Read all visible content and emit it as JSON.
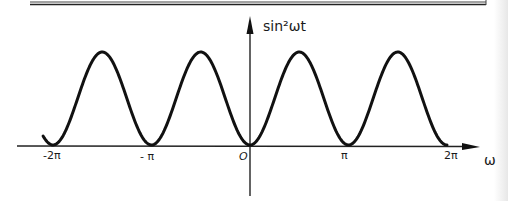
{
  "chart_data": {
    "type": "line",
    "title": "",
    "function": "sin^2(ωt)",
    "xlabel": "ω",
    "ylabel": "sin²ωt",
    "x_tick_labels": [
      "-2π",
      "- π",
      "O",
      "π",
      "2π"
    ],
    "x_ticks": [
      -6.2832,
      -3.1416,
      0,
      3.1416,
      6.2832
    ],
    "xlim": [
      -7.0,
      7.6
    ],
    "ylim": [
      0,
      1.1
    ],
    "grid": false,
    "legend": "none",
    "series": [
      {
        "name": "sin²ωt",
        "x": [
          -6.6,
          -6.2832,
          -5.4978,
          -4.7124,
          -3.927,
          -3.1416,
          -2.3562,
          -1.5708,
          -0.7854,
          0,
          0.7854,
          1.5708,
          2.3562,
          3.1416,
          3.927,
          4.7124,
          5.4978,
          6.2832
        ],
        "values": [
          0.1,
          0,
          0.5,
          1,
          0.5,
          0,
          0.5,
          1,
          0.5,
          0,
          0.5,
          1,
          0.5,
          0,
          0.5,
          1,
          0.5,
          0
        ]
      }
    ],
    "peaks_x": [
      -4.7124,
      -1.5708,
      1.5708,
      4.7124
    ],
    "zeros_x": [
      -6.2832,
      -3.1416,
      0,
      3.1416,
      6.2832
    ],
    "style": "hand-drawn"
  },
  "labels": {
    "y_axis": "sin²ωt",
    "x_axis": "ω",
    "ticks": {
      "neg_two_pi": "-2π",
      "neg_pi": "- π",
      "origin": "O",
      "pi": "π",
      "two_pi": "2π"
    }
  },
  "colors": {
    "ink": "#111111",
    "background": "#ffffff",
    "frame": "#333333"
  }
}
